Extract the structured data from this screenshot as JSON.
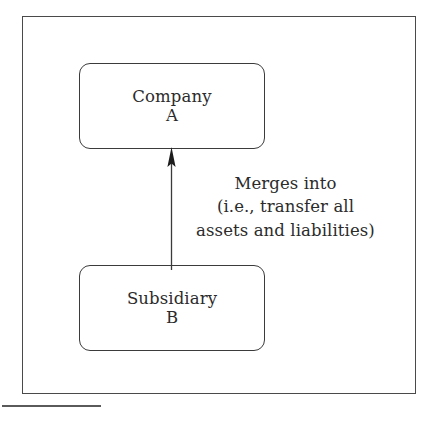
{
  "figure": {
    "type": "entity-relationship-diagram",
    "background_color": "#ffffff",
    "line_color": "#3b3b3b",
    "text_color": "#2b2b2b",
    "frame": {
      "name": "figure-border"
    },
    "nodes": [
      {
        "id": "company-a",
        "name": "Company",
        "designator": "A",
        "shape": "rounded-rectangle",
        "position": "top"
      },
      {
        "id": "subsidiary-b",
        "name": "Subsidiary",
        "designator": "B",
        "shape": "rounded-rectangle",
        "position": "bottom"
      }
    ],
    "edges": [
      {
        "id": "merge-arrow",
        "from": "subsidiary-b",
        "to": "company-a",
        "direction": "up",
        "arrowhead": "solid-filled",
        "label_lines": [
          "Merges into",
          "(i.e., transfer all",
          "assets and liabilities)"
        ]
      }
    ],
    "caption_rule": {
      "name": "caption-rule",
      "color": "#5a5a5a"
    }
  }
}
